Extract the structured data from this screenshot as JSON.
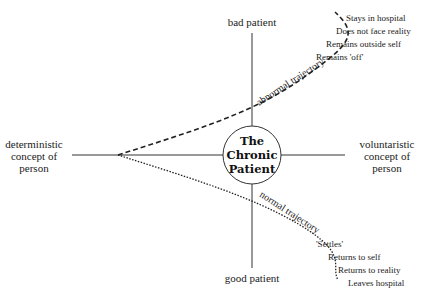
{
  "diagram": {
    "center_label": [
      "The",
      "Chronic",
      "Patient"
    ],
    "axes": {
      "top": "bad patient",
      "bottom": "good patient",
      "left": [
        "deterministic",
        "concept of",
        "person"
      ],
      "right": [
        "voluntaristic",
        "concept of",
        "person"
      ]
    },
    "trajectories": {
      "abnormal": {
        "label": "abnormal trajectory",
        "style": "dashed",
        "outcomes": [
          "Stays in hospital",
          "Does not face reality",
          "Remains outside self",
          "Remains 'off'"
        ]
      },
      "normal": {
        "label": "normal trajectory",
        "style": "dotted",
        "outcomes": [
          "'Settles'",
          "Returns to self",
          "Returns to reality",
          "Leaves hospital"
        ]
      }
    }
  }
}
